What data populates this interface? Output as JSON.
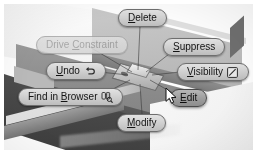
{
  "app": {
    "name": "3D CAD modeling application",
    "view_type": "context-marking-menu-overlay"
  },
  "scene": {
    "description": "Shaded isometric 3D solid model of angled plates",
    "selected_feature": "highlighted-plate-at-menu-center"
  },
  "cursor": {
    "name": "arrow-pointer",
    "x": 165,
    "y": 87,
    "hovering": "Edit"
  },
  "menu": {
    "name": "radial-marking-menu",
    "items": [
      {
        "id": "delete",
        "label": "Delete",
        "mnemonic": "D",
        "position": "top",
        "state": "enabled",
        "icon": null
      },
      {
        "id": "drive-constraint",
        "label": "Drive Constraint",
        "mnemonic": "C",
        "position": "upper-left",
        "state": "disabled",
        "icon": null
      },
      {
        "id": "suppress",
        "label": "Suppress",
        "mnemonic": "S",
        "position": "upper-right",
        "state": "enabled",
        "icon": null
      },
      {
        "id": "undo",
        "label": "Undo",
        "mnemonic": "U",
        "position": "left",
        "state": "enabled",
        "icon": "undo-arrow-icon"
      },
      {
        "id": "visibility",
        "label": "Visibility",
        "mnemonic": "V",
        "position": "right",
        "state": "enabled",
        "icon": "checkbox-checked-icon",
        "checked": true
      },
      {
        "id": "find-in-browser",
        "label": "Find in Browser",
        "mnemonic": "B",
        "position": "lower-left",
        "state": "enabled",
        "icon": "binoculars-icon"
      },
      {
        "id": "edit",
        "label": "Edit",
        "mnemonic": "E",
        "position": "lower-right",
        "state": "highlighted",
        "icon": null
      },
      {
        "id": "modify",
        "label": "Modify",
        "mnemonic": "M",
        "position": "bottom",
        "state": "enabled",
        "icon": null
      }
    ]
  },
  "colors": {
    "button_face_light": "#e2e2e2",
    "button_face_dark": "#bdbdbd",
    "button_border": "#6e6e6e",
    "button_text": "#141414",
    "disabled_text": "#9b9b9b",
    "highlight_face": "#9f9f9f",
    "scene_dark": "#3f3f3f",
    "scene_mid": "#8a8a8a",
    "scene_light": "#c9c9c9",
    "page_background": "#ffffff"
  }
}
